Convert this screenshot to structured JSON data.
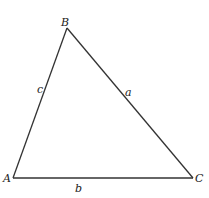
{
  "diagram": {
    "type": "triangle",
    "vertices": [
      {
        "id": "A",
        "label": "A",
        "x": 13,
        "y": 178
      },
      {
        "id": "B",
        "label": "B",
        "x": 67,
        "y": 28
      },
      {
        "id": "C",
        "label": "C",
        "x": 193,
        "y": 178
      }
    ],
    "sides": [
      {
        "id": "a",
        "label": "a",
        "from": "B",
        "to": "C"
      },
      {
        "id": "b",
        "label": "b",
        "from": "A",
        "to": "C"
      },
      {
        "id": "c",
        "label": "c",
        "from": "A",
        "to": "B"
      }
    ],
    "line_color": "#333333"
  }
}
